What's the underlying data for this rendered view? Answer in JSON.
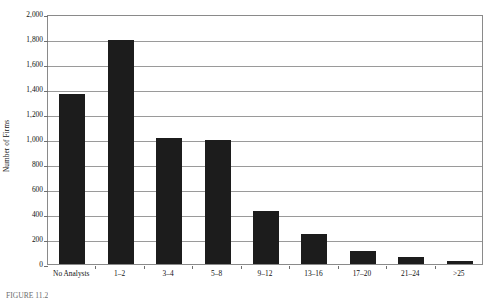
{
  "figure": {
    "caption": "FIGURE 11.2"
  },
  "chart_data": {
    "type": "bar",
    "title": "",
    "xlabel": "",
    "ylabel": "Number of Firms",
    "categories": [
      "No Analysts",
      "1–2",
      "3–4",
      "5–8",
      "9–12",
      "13–16",
      "17–20",
      "21–24",
      ">25"
    ],
    "values": [
      1360,
      1795,
      1010,
      995,
      425,
      240,
      105,
      60,
      25
    ],
    "ylim": [
      0,
      2000
    ],
    "yticks": [
      0,
      200,
      400,
      600,
      800,
      1000,
      1200,
      1400,
      1600,
      1800,
      2000
    ],
    "ytick_labels": [
      "0",
      "200",
      "400",
      "600",
      "800",
      "1,000",
      "1,200",
      "1,400",
      "1,600",
      "1,800",
      "2,000"
    ],
    "grid": true,
    "legend": false,
    "bar_color": "#1c1c1c",
    "gridline_color": "#9a9a9a",
    "axis_color": "#8a8a8a"
  }
}
